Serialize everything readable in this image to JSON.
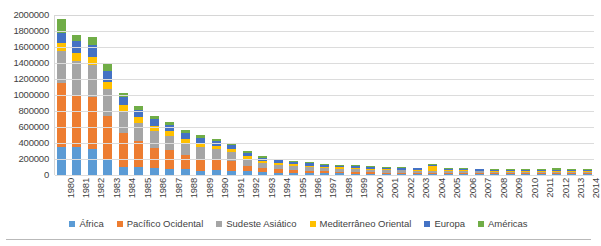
{
  "chart_data": {
    "type": "bar",
    "stacked": true,
    "title": "",
    "subtitle": "",
    "xlabel": "",
    "ylabel": "",
    "ylim": [
      0,
      2000000
    ],
    "ytick_step": 200000,
    "ytick_labels": [
      "2000000",
      "1800000",
      "1600000",
      "1400000",
      "1200000",
      "1000000",
      "800000",
      "600000",
      "400000",
      "200000",
      "0"
    ],
    "grid": true,
    "legend_position": "bottom",
    "categories": [
      "1980",
      "1981",
      "1982",
      "1983",
      "1984",
      "1985",
      "1986",
      "1987",
      "1988",
      "1989",
      "1990",
      "1991",
      "1992",
      "1993",
      "1994",
      "1995",
      "1996",
      "1997",
      "1998",
      "1999",
      "2000",
      "2001",
      "2002",
      "2003",
      "2004",
      "2005",
      "2006",
      "2007",
      "2008",
      "2009",
      "2010",
      "2011",
      "2012",
      "2013",
      "2014"
    ],
    "series": [
      {
        "name": "África",
        "color": "#5b9bd5",
        "values": [
          350000,
          350000,
          325000,
          190000,
          100000,
          95000,
          90000,
          80000,
          75000,
          55000,
          60000,
          55000,
          45000,
          35000,
          30000,
          25000,
          25000,
          22000,
          20000,
          18000,
          16000,
          15000,
          14000,
          13000,
          12000,
          12000,
          11000,
          11000,
          10000,
          10000,
          10000,
          10000,
          9000,
          9000,
          9000
        ]
      },
      {
        "name": "Pacífico Ocidental",
        "color": "#ed7d31",
        "values": [
          800000,
          650000,
          650000,
          550000,
          430000,
          330000,
          250000,
          230000,
          170000,
          150000,
          130000,
          120000,
          70000,
          50000,
          40000,
          33000,
          28000,
          25000,
          22000,
          20000,
          18000,
          16000,
          15000,
          14000,
          13000,
          13000,
          12000,
          12000,
          11000,
          11000,
          11000,
          11000,
          11000,
          10000,
          10000
        ]
      },
      {
        "name": "Sudeste Asiático",
        "color": "#a5a5a5",
        "values": [
          400000,
          430000,
          400000,
          330000,
          260000,
          230000,
          210000,
          180000,
          160000,
          150000,
          130000,
          110000,
          90000,
          70000,
          60000,
          55000,
          48000,
          42000,
          38000,
          35000,
          32000,
          30000,
          28000,
          26000,
          25000,
          24000,
          23000,
          22000,
          21000,
          20000,
          20000,
          19000,
          19000,
          18000,
          18000
        ]
      },
      {
        "name": "Mediterrâneo Oriental",
        "color": "#ffc000",
        "values": [
          100000,
          100000,
          100000,
          90000,
          80000,
          65000,
          60000,
          55000,
          50000,
          45000,
          42000,
          40000,
          30000,
          25000,
          22000,
          20000,
          18000,
          16000,
          15000,
          14000,
          13000,
          12000,
          11000,
          11000,
          60000,
          12000,
          11000,
          11000,
          10000,
          10000,
          10000,
          10000,
          12000,
          10000,
          10000
        ]
      },
      {
        "name": "Europa",
        "color": "#4472c4",
        "values": [
          130000,
          150000,
          150000,
          140000,
          110000,
          95000,
          85000,
          78000,
          70000,
          65000,
          60000,
          55000,
          45000,
          38000,
          33000,
          30000,
          28000,
          26000,
          24000,
          22000,
          21000,
          20000,
          19000,
          18000,
          18000,
          17000,
          17000,
          16000,
          16000,
          15000,
          15000,
          15000,
          15000,
          14000,
          14000
        ]
      },
      {
        "name": "Américas",
        "color": "#70ad47",
        "values": [
          170000,
          70000,
          100000,
          100000,
          45000,
          42000,
          40000,
          36000,
          33000,
          30000,
          28000,
          26000,
          22000,
          19000,
          17000,
          15000,
          14000,
          13000,
          12000,
          11000,
          11000,
          10000,
          10000,
          9000,
          9000,
          9000,
          9000,
          9000,
          8000,
          8000,
          8000,
          8000,
          22000,
          9000,
          9000
        ]
      }
    ]
  }
}
